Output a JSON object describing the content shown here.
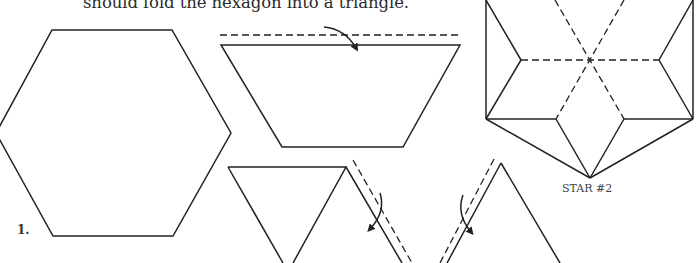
{
  "document": {
    "caption": "should fold the hexagon into a triangle.",
    "step_number": "1.",
    "star_label": "STAR #2"
  },
  "figures": [
    {
      "name": "hexagon",
      "description": "Regular hexagon outline (step 1)"
    },
    {
      "name": "trapezoid-fold",
      "description": "Trapezoid with dashed fold line above and curved arrow pointing down"
    },
    {
      "name": "triangle-fold-right",
      "description": "Inverted triangle with dashed fold line on right edge and curved arrow"
    },
    {
      "name": "triangle-fold-left",
      "description": "Triangle with dashed fold line on left edge and curved arrow"
    },
    {
      "name": "star-2",
      "description": "Folded star figure with dashed crease lines through center"
    }
  ]
}
